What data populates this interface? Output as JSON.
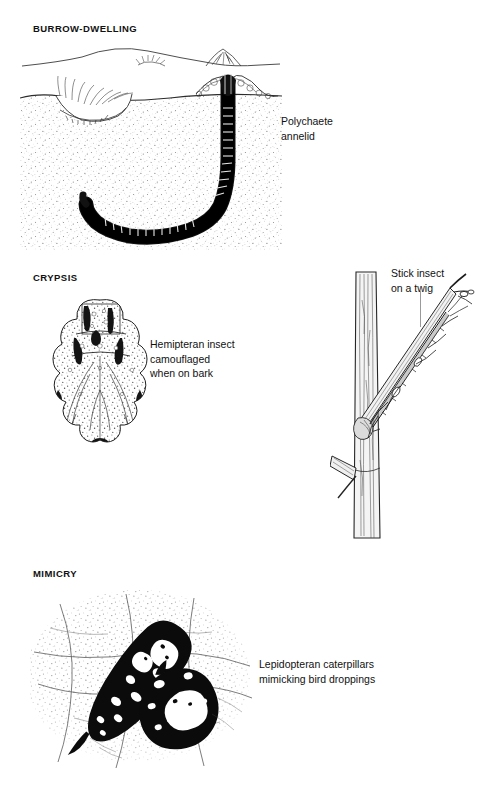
{
  "figure": {
    "background_color": "#ffffff",
    "ink_color": "#111111",
    "leader_line_color": "#9a9a9a"
  },
  "sections": [
    {
      "id": "burrow",
      "heading": "BURROW-DWELLING",
      "caption": "Polychaete\nannelid",
      "caption_subject": "polychaete annelid in a U-shaped burrow",
      "has_leader_line": false
    },
    {
      "id": "crypsis",
      "heading": "CRYPSIS",
      "caption": "Hemipteran insect\ncamouflaged\nwhen on bark",
      "caption_subject": "mottled hemipteran insect",
      "has_leader_line": false
    },
    {
      "id": "stick-insect",
      "heading": "",
      "caption": "Stick insect\non a twig",
      "caption_subject": "stick insect resting along a twig",
      "has_leader_line": true
    },
    {
      "id": "mimicry",
      "heading": "MIMICRY",
      "caption": "Lepidopteran caterpillars\nmimicking bird droppings",
      "caption_subject": "two caterpillars resembling bird droppings on a leaf",
      "has_leader_line": false
    }
  ]
}
